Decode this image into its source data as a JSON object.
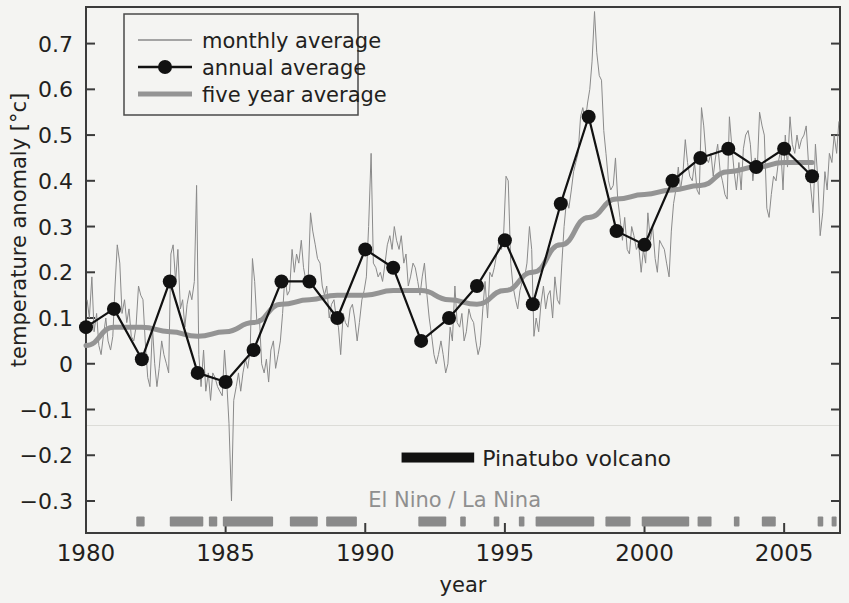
{
  "chart_data": {
    "type": "line",
    "title": "",
    "xlabel": "year",
    "ylabel": "temperature anomaly [°c]",
    "xlim": [
      1980,
      2007
    ],
    "ylim": [
      -0.37,
      0.78
    ],
    "grid": false,
    "legend_position": "top-left",
    "xticks": [
      1980,
      1985,
      1990,
      1995,
      2000,
      2005
    ],
    "xticklabels": [
      "1980",
      "1985",
      "1990",
      "1995",
      "2000",
      "2005"
    ],
    "yticks": [
      -0.3,
      -0.2,
      -0.1,
      0,
      0.1,
      0.2,
      0.3,
      0.4,
      0.5,
      0.6,
      0.7
    ],
    "yticklabels": [
      "−0.3",
      "−0.2",
      "−0.1",
      "0",
      "0.1",
      "0.2",
      "0.3",
      "0.4",
      "0.5",
      "0.6",
      "0.7"
    ],
    "series": [
      {
        "name": "monthly average",
        "type": "line",
        "color": "#8a8a8a",
        "linewidth": 1,
        "x": [
          1980.04,
          1980.12,
          1980.21,
          1980.29,
          1980.38,
          1980.46,
          1980.54,
          1980.62,
          1980.71,
          1980.79,
          1980.88,
          1980.96,
          1981.04,
          1981.12,
          1981.21,
          1981.29,
          1981.38,
          1981.46,
          1981.54,
          1981.62,
          1981.71,
          1981.79,
          1981.88,
          1981.96,
          1982.04,
          1982.12,
          1982.21,
          1982.29,
          1982.38,
          1982.46,
          1982.54,
          1982.62,
          1982.71,
          1982.79,
          1982.88,
          1982.96,
          1983.04,
          1983.12,
          1983.21,
          1983.29,
          1983.38,
          1983.46,
          1983.54,
          1983.62,
          1983.71,
          1983.79,
          1983.88,
          1983.96,
          1984.04,
          1984.12,
          1984.21,
          1984.29,
          1984.38,
          1984.46,
          1984.54,
          1984.62,
          1984.71,
          1984.79,
          1984.88,
          1984.96,
          1985.04,
          1985.12,
          1985.21,
          1985.29,
          1985.38,
          1985.46,
          1985.54,
          1985.62,
          1985.71,
          1985.79,
          1985.88,
          1985.96,
          1986.04,
          1986.12,
          1986.21,
          1986.29,
          1986.38,
          1986.46,
          1986.54,
          1986.62,
          1986.71,
          1986.79,
          1986.88,
          1986.96,
          1987.04,
          1987.12,
          1987.21,
          1987.29,
          1987.38,
          1987.46,
          1987.54,
          1987.62,
          1987.71,
          1987.79,
          1987.88,
          1987.96,
          1988.04,
          1988.12,
          1988.21,
          1988.29,
          1988.38,
          1988.46,
          1988.54,
          1988.62,
          1988.71,
          1988.79,
          1988.88,
          1988.96,
          1989.04,
          1989.12,
          1989.21,
          1989.29,
          1989.38,
          1989.46,
          1989.54,
          1989.62,
          1989.71,
          1989.79,
          1989.88,
          1989.96,
          1990.04,
          1990.12,
          1990.21,
          1990.29,
          1990.38,
          1990.46,
          1990.54,
          1990.62,
          1990.71,
          1990.79,
          1990.88,
          1990.96,
          1991.04,
          1991.12,
          1991.21,
          1991.29,
          1991.38,
          1991.46,
          1991.54,
          1991.62,
          1991.71,
          1991.79,
          1991.88,
          1991.96,
          1992.04,
          1992.12,
          1992.21,
          1992.29,
          1992.38,
          1992.46,
          1992.54,
          1992.62,
          1992.71,
          1992.79,
          1992.88,
          1992.96,
          1993.04,
          1993.12,
          1993.21,
          1993.29,
          1993.38,
          1993.46,
          1993.54,
          1993.62,
          1993.71,
          1993.79,
          1993.88,
          1993.96,
          1994.04,
          1994.12,
          1994.21,
          1994.29,
          1994.38,
          1994.46,
          1994.54,
          1994.62,
          1994.71,
          1994.79,
          1994.88,
          1994.96,
          1995.04,
          1995.12,
          1995.21,
          1995.29,
          1995.38,
          1995.46,
          1995.54,
          1995.62,
          1995.71,
          1995.79,
          1995.88,
          1995.96,
          1996.04,
          1996.12,
          1996.21,
          1996.29,
          1996.38,
          1996.46,
          1996.54,
          1996.62,
          1996.71,
          1996.79,
          1996.88,
          1996.96,
          1997.04,
          1997.12,
          1997.21,
          1997.29,
          1997.38,
          1997.46,
          1997.54,
          1997.62,
          1997.71,
          1997.79,
          1997.88,
          1997.96,
          1998.04,
          1998.12,
          1998.21,
          1998.29,
          1998.38,
          1998.46,
          1998.54,
          1998.62,
          1998.71,
          1998.79,
          1998.88,
          1998.96,
          1999.04,
          1999.12,
          1999.21,
          1999.29,
          1999.38,
          1999.46,
          1999.54,
          1999.62,
          1999.71,
          1999.79,
          1999.88,
          1999.96,
          2000.04,
          2000.12,
          2000.21,
          2000.29,
          2000.38,
          2000.46,
          2000.54,
          2000.62,
          2000.71,
          2000.79,
          2000.88,
          2000.96,
          2001.04,
          2001.12,
          2001.21,
          2001.29,
          2001.38,
          2001.46,
          2001.54,
          2001.62,
          2001.71,
          2001.79,
          2001.88,
          2001.96,
          2002.04,
          2002.12,
          2002.21,
          2002.29,
          2002.38,
          2002.46,
          2002.54,
          2002.62,
          2002.71,
          2002.79,
          2002.88,
          2002.96,
          2003.04,
          2003.12,
          2003.21,
          2003.29,
          2003.38,
          2003.46,
          2003.54,
          2003.62,
          2003.71,
          2003.79,
          2003.88,
          2003.96,
          2004.04,
          2004.12,
          2004.21,
          2004.29,
          2004.38,
          2004.46,
          2004.54,
          2004.62,
          2004.71,
          2004.79,
          2004.88,
          2004.96,
          2005.04,
          2005.12,
          2005.21,
          2005.29,
          2005.38,
          2005.46,
          2005.54,
          2005.62,
          2005.71,
          2005.79,
          2005.88,
          2005.96,
          2006.04,
          2006.12,
          2006.21,
          2006.29,
          2006.38,
          2006.46,
          2006.54,
          2006.62,
          2006.71,
          2006.79,
          2006.88,
          2006.96
        ],
        "y": [
          0.14,
          0.1,
          0.19,
          0.07,
          0.11,
          0.04,
          0.02,
          0.06,
          0.1,
          0.05,
          0.03,
          0.06,
          0.17,
          0.26,
          0.22,
          0.11,
          0.14,
          0.09,
          0.12,
          0.06,
          0.05,
          0.08,
          0.17,
          0.15,
          0.14,
          0.05,
          -0.03,
          -0.05,
          0.08,
          0.0,
          -0.05,
          -0.01,
          0.05,
          0.02,
          0.0,
          -0.02,
          0.24,
          0.26,
          0.18,
          0.25,
          0.12,
          0.14,
          0.08,
          0.13,
          0.16,
          0.14,
          0.18,
          0.39,
          0.02,
          -0.05,
          0.03,
          -0.06,
          -0.02,
          -0.08,
          -0.02,
          -0.03,
          -0.05,
          -0.06,
          -0.07,
          0.03,
          -0.04,
          -0.13,
          -0.3,
          -0.08,
          -0.05,
          -0.02,
          -0.06,
          -0.02,
          0.01,
          -0.01,
          0.03,
          0.23,
          0.18,
          0.09,
          0.1,
          0.0,
          -0.02,
          0.01,
          -0.04,
          0.03,
          0.05,
          -0.01,
          0.02,
          0.05,
          0.11,
          0.19,
          0.15,
          0.16,
          0.25,
          0.2,
          0.24,
          0.22,
          0.27,
          0.21,
          0.18,
          0.19,
          0.33,
          0.29,
          0.26,
          0.23,
          0.22,
          0.17,
          0.15,
          0.17,
          0.1,
          0.13,
          0.14,
          0.1,
          0.08,
          0.02,
          0.11,
          0.09,
          0.08,
          0.12,
          0.13,
          0.1,
          0.05,
          0.09,
          0.14,
          0.16,
          0.19,
          0.3,
          0.46,
          0.22,
          0.21,
          0.19,
          0.2,
          0.18,
          0.22,
          0.26,
          0.28,
          0.25,
          0.3,
          0.27,
          0.25,
          0.28,
          0.22,
          0.24,
          0.17,
          0.19,
          0.22,
          0.21,
          0.18,
          0.15,
          0.19,
          0.22,
          0.15,
          0.1,
          0.06,
          0.02,
          0.0,
          0.02,
          0.05,
          0.02,
          -0.02,
          0.0,
          0.08,
          0.05,
          0.17,
          0.09,
          0.08,
          0.11,
          0.05,
          0.07,
          0.12,
          0.1,
          0.09,
          0.05,
          0.02,
          0.04,
          0.12,
          0.18,
          0.1,
          0.2,
          0.19,
          0.21,
          0.24,
          0.27,
          0.25,
          0.29,
          0.41,
          0.4,
          0.22,
          0.17,
          0.14,
          0.12,
          0.16,
          0.18,
          0.19,
          0.22,
          0.3,
          0.25,
          0.06,
          0.1,
          0.07,
          0.13,
          0.17,
          0.12,
          0.15,
          0.16,
          0.1,
          0.19,
          0.14,
          0.13,
          0.22,
          0.3,
          0.36,
          0.34,
          0.38,
          0.42,
          0.44,
          0.46,
          0.54,
          0.56,
          0.53,
          0.57,
          0.6,
          0.66,
          0.77,
          0.68,
          0.63,
          0.62,
          0.51,
          0.46,
          0.4,
          0.38,
          0.39,
          0.45,
          0.36,
          0.32,
          0.27,
          0.32,
          0.25,
          0.24,
          0.3,
          0.28,
          0.25,
          0.26,
          0.2,
          0.25,
          0.22,
          0.33,
          0.27,
          0.3,
          0.23,
          0.2,
          0.27,
          0.26,
          0.25,
          0.22,
          0.19,
          0.29,
          0.35,
          0.38,
          0.43,
          0.38,
          0.42,
          0.49,
          0.44,
          0.41,
          0.4,
          0.44,
          0.38,
          0.37,
          0.56,
          0.52,
          0.45,
          0.44,
          0.46,
          0.41,
          0.45,
          0.48,
          0.42,
          0.4,
          0.37,
          0.36,
          0.54,
          0.48,
          0.42,
          0.38,
          0.44,
          0.38,
          0.47,
          0.5,
          0.51,
          0.48,
          0.4,
          0.45,
          0.43,
          0.55,
          0.52,
          0.5,
          0.34,
          0.32,
          0.37,
          0.41,
          0.4,
          0.44,
          0.47,
          0.38,
          0.5,
          0.43,
          0.54,
          0.48,
          0.46,
          0.5,
          0.47,
          0.49,
          0.5,
          0.52,
          0.43,
          0.38,
          0.33,
          0.48,
          0.4,
          0.28,
          0.33,
          0.42,
          0.38,
          0.46,
          0.44,
          0.5,
          0.46,
          0.53
        ]
      },
      {
        "name": "annual average",
        "type": "line-markers",
        "color": "#111111",
        "linewidth": 2.2,
        "marker_size": 7,
        "x": [
          1980,
          1981,
          1982,
          1983,
          1984,
          1985,
          1986,
          1987,
          1988,
          1989,
          1990,
          1991,
          1992,
          1993,
          1994,
          1995,
          1996,
          1997,
          1998,
          1999,
          2000,
          2001,
          2002,
          2003,
          2004,
          2005,
          2006
        ],
        "y": [
          0.08,
          0.12,
          0.01,
          0.18,
          -0.02,
          -0.04,
          0.03,
          0.18,
          0.18,
          0.1,
          0.25,
          0.21,
          0.05,
          0.1,
          0.17,
          0.27,
          0.13,
          0.35,
          0.54,
          0.29,
          0.26,
          0.4,
          0.45,
          0.47,
          0.43,
          0.47,
          0.41
        ]
      },
      {
        "name": "five year average",
        "type": "line",
        "color": "#949494",
        "linewidth": 5,
        "x": [
          1980,
          1981,
          1982,
          1983,
          1984,
          1985,
          1986,
          1987,
          1988,
          1989,
          1990,
          1991,
          1992,
          1993,
          1994,
          1995,
          1996,
          1997,
          1998,
          1999,
          2000,
          2001,
          2002,
          2003,
          2004,
          2005,
          2006
        ],
        "y": [
          0.04,
          0.08,
          0.08,
          0.07,
          0.06,
          0.07,
          0.09,
          0.13,
          0.14,
          0.15,
          0.15,
          0.16,
          0.16,
          0.14,
          0.13,
          0.16,
          0.2,
          0.26,
          0.32,
          0.36,
          0.37,
          0.38,
          0.39,
          0.42,
          0.43,
          0.44,
          0.44
        ]
      }
    ],
    "annotations": [
      {
        "name": "pinatubo",
        "label": "Pinatubo volcano",
        "marker": "bar",
        "color": "#111111",
        "x_start": 1991.3,
        "x_end": 1993.9,
        "y": -0.205
      },
      {
        "name": "elnino-lanina",
        "label": "El Nino / La Nina",
        "color": "#8f8f8f",
        "x": 1993.2,
        "y": -0.295
      }
    ],
    "event_bars": {
      "name": "El Nino / La Nina",
      "color": "#8a8a8a",
      "y": -0.345,
      "segments": [
        {
          "x_start": 1981.8,
          "x_end": 1982.1
        },
        {
          "x_start": 1983.0,
          "x_end": 1984.2
        },
        {
          "x_start": 1984.4,
          "x_end": 1984.7
        },
        {
          "x_start": 1984.9,
          "x_end": 1986.7
        },
        {
          "x_start": 1987.3,
          "x_end": 1988.3
        },
        {
          "x_start": 1988.6,
          "x_end": 1989.7
        },
        {
          "x_start": 1991.9,
          "x_end": 1992.9
        },
        {
          "x_start": 1993.4,
          "x_end": 1993.6
        },
        {
          "x_start": 1994.6,
          "x_end": 1994.8
        },
        {
          "x_start": 1995.5,
          "x_end": 1995.7
        },
        {
          "x_start": 1996.1,
          "x_end": 1998.2
        },
        {
          "x_start": 1998.6,
          "x_end": 1999.5
        },
        {
          "x_start": 1999.9,
          "x_end": 2001.6
        },
        {
          "x_start": 2001.9,
          "x_end": 2002.4
        },
        {
          "x_start": 2003.2,
          "x_end": 2003.4
        },
        {
          "x_start": 2004.2,
          "x_end": 2004.7
        },
        {
          "x_start": 2006.2,
          "x_end": 2006.4
        },
        {
          "x_start": 2006.7,
          "x_end": 2006.85
        }
      ]
    },
    "legend": {
      "entries": [
        {
          "label": "monthly average",
          "color": "#8a8a8a",
          "style": "thin-line"
        },
        {
          "label": "annual average",
          "color": "#111111",
          "style": "line-marker"
        },
        {
          "label": "five year average",
          "color": "#949494",
          "style": "thick-line"
        }
      ]
    }
  },
  "figure": {
    "background": "#f4f4f2",
    "axis_color": "#3b3b3b"
  }
}
